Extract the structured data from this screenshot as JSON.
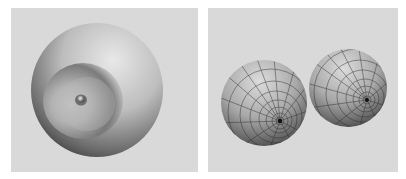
{
  "figure": {
    "panels": [
      {
        "id": "left",
        "description": "Smooth shaded sphere with a funnel-shaped dimple and small nub at its center",
        "background_color": "#d9d9d9"
      },
      {
        "id": "right",
        "description": "Two wireframe-shaded spheres, each with converging grid lines at a pole",
        "background_color": "#d9d9d9"
      }
    ]
  }
}
